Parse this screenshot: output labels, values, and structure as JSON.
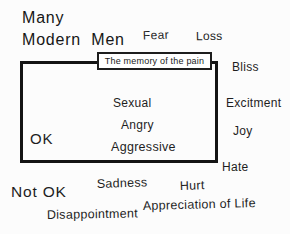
{
  "diagram": {
    "heading": {
      "line1": "Many",
      "line2": "Modern Men"
    },
    "pain_box_label": "The memory of the pain",
    "inside_box": {
      "ok_label": "OK",
      "emotions": [
        "Sexual",
        "Angry",
        "Aggressive"
      ]
    },
    "top_labels": {
      "fear": "Fear",
      "loss": "Loss"
    },
    "right_labels": {
      "bliss": "Bliss",
      "excitment": "Excitment",
      "joy": "Joy",
      "hate": "Hate"
    },
    "bottom_labels": {
      "not_ok": "Not OK",
      "sadness": "Sadness",
      "hurt": "Hurt",
      "appreciation": "Appreciation of Life",
      "disappointment": "Disappointment"
    },
    "colors": {
      "background": "#fcfcfc",
      "text": "#1e1e1e",
      "box_border": "#141414",
      "pain_box_fill": "#ffffff"
    }
  }
}
